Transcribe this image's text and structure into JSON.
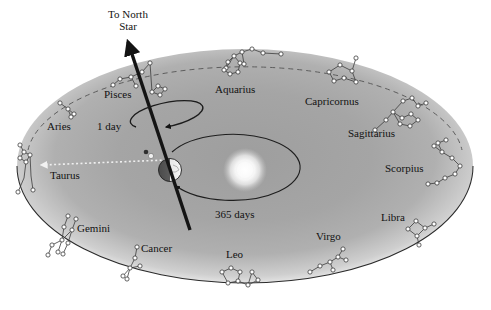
{
  "figure": {
    "type": "astronomy-diagram",
    "background_color": "#ffffff",
    "disc_color": "#a8a8a8",
    "line_color": "#1a1a1a",
    "star_color": "#ffffff"
  },
  "annotations": {
    "north_star_line1": "To North",
    "north_star_line2": "Star",
    "rotation_period": "1 day",
    "orbital_period": "365 days"
  },
  "bodies": {
    "earth_name": "Earth",
    "sun_name": "Sun",
    "moon_name": "Moon"
  },
  "constellations": [
    {
      "name": "Pisces",
      "lx": 104,
      "ly": 88,
      "anchor": "start"
    },
    {
      "name": "Aquarius",
      "lx": 215,
      "ly": 83,
      "anchor": "start"
    },
    {
      "name": "Capricornus",
      "lx": 305,
      "ly": 95,
      "anchor": "start"
    },
    {
      "name": "Sagittarius",
      "lx": 348,
      "ly": 127,
      "anchor": "start"
    },
    {
      "name": "Scorpius",
      "lx": 385,
      "ly": 162,
      "anchor": "start"
    },
    {
      "name": "Libra",
      "lx": 381,
      "ly": 211,
      "anchor": "start"
    },
    {
      "name": "Virgo",
      "lx": 316,
      "ly": 230,
      "anchor": "start"
    },
    {
      "name": "Leo",
      "lx": 226,
      "ly": 248,
      "anchor": "start"
    },
    {
      "name": "Cancer",
      "lx": 141,
      "ly": 242,
      "anchor": "start"
    },
    {
      "name": "Gemini",
      "lx": 77,
      "ly": 222,
      "anchor": "start"
    },
    {
      "name": "Taurus",
      "lx": 50,
      "ly": 169,
      "anchor": "start"
    },
    {
      "name": "Aries",
      "lx": 47,
      "ly": 120,
      "anchor": "start"
    }
  ]
}
